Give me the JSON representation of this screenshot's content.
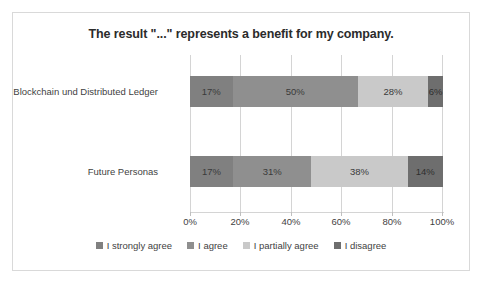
{
  "chart_data": {
    "type": "bar",
    "orientation": "horizontal",
    "stacked": true,
    "title": "The result \"...\" represents a benefit for my company.",
    "xlabel": "",
    "ylabel": "",
    "xlim": [
      0,
      100
    ],
    "grid": true,
    "legend_position": "bottom",
    "categories": [
      "Blockchain und Distributed Ledger",
      "Future Personas"
    ],
    "tick_labels": [
      "0%",
      "20%",
      "40%",
      "60%",
      "80%",
      "100%"
    ],
    "tick_values": [
      0,
      20,
      40,
      60,
      80,
      100
    ],
    "series": [
      {
        "name": "I strongly agree",
        "color": "#808080",
        "values": [
          17,
          17
        ],
        "labels": [
          "17%",
          "17%"
        ]
      },
      {
        "name": "I agree",
        "color": "#8f8f8f",
        "values": [
          50,
          31
        ],
        "labels": [
          "50%",
          "31%"
        ]
      },
      {
        "name": "I partially agree",
        "color": "#c9c9c9",
        "values": [
          28,
          38
        ],
        "labels": [
          "28%",
          "38%"
        ]
      },
      {
        "name": "I disagree",
        "color": "#6e6e6e",
        "values": [
          6,
          14
        ],
        "labels": [
          "6%",
          "14%"
        ]
      }
    ]
  }
}
